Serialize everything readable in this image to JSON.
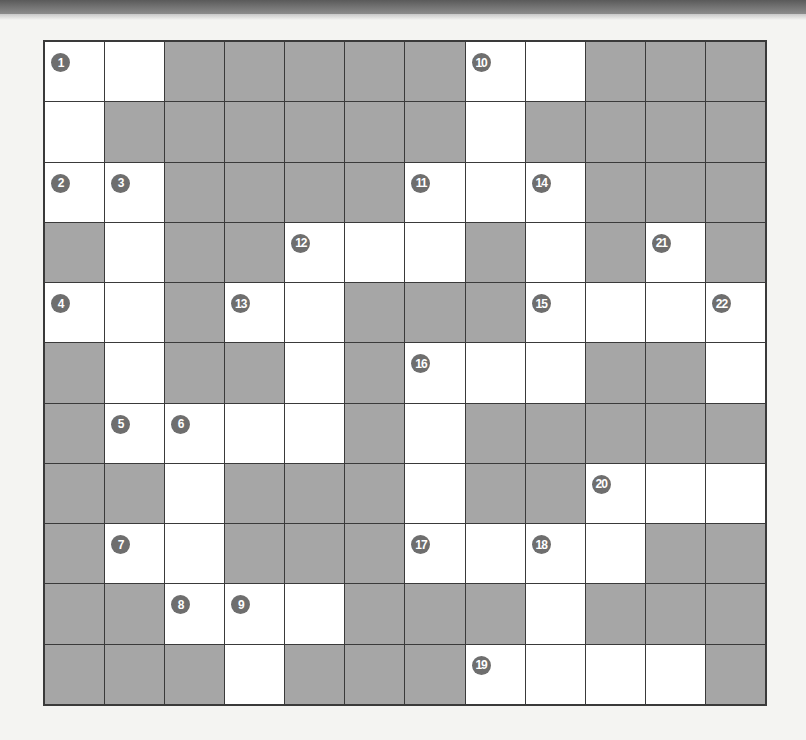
{
  "puzzle": {
    "type": "crossword",
    "rows": 11,
    "cols": 12,
    "colors": {
      "black_cell": "#a6a6a6",
      "white_cell": "#ffffff",
      "grid_line": "#3a3a3a",
      "clue_badge": "#6e6e6e"
    },
    "grid": [
      [
        "1",
        "W",
        "B",
        "B",
        "B",
        "B",
        "B",
        "10",
        "W",
        "B",
        "B",
        "B"
      ],
      [
        "W",
        "B",
        "B",
        "B",
        "B",
        "B",
        "B",
        "W",
        "B",
        "B",
        "B",
        "B"
      ],
      [
        "2",
        "3",
        "B",
        "B",
        "B",
        "B",
        "11",
        "W",
        "14",
        "B",
        "B",
        "B"
      ],
      [
        "B",
        "W",
        "B",
        "B",
        "12",
        "W",
        "W",
        "B",
        "W",
        "B",
        "21",
        "B"
      ],
      [
        "4",
        "W",
        "B",
        "13",
        "W",
        "B",
        "B",
        "B",
        "15",
        "W",
        "W",
        "22"
      ],
      [
        "B",
        "W",
        "B",
        "B",
        "W",
        "B",
        "16",
        "W",
        "W",
        "B",
        "B",
        "W"
      ],
      [
        "B",
        "5",
        "6",
        "W",
        "W",
        "B",
        "W",
        "B",
        "B",
        "B",
        "B",
        "B"
      ],
      [
        "B",
        "B",
        "W",
        "B",
        "B",
        "B",
        "W",
        "B",
        "B",
        "20",
        "W",
        "W"
      ],
      [
        "B",
        "7",
        "W",
        "B",
        "B",
        "B",
        "17",
        "W",
        "18",
        "W",
        "B",
        "B"
      ],
      [
        "B",
        "B",
        "8",
        "9",
        "W",
        "B",
        "B",
        "B",
        "W",
        "B",
        "B",
        "B"
      ],
      [
        "B",
        "B",
        "B",
        "W",
        "B",
        "B",
        "B",
        "19",
        "W",
        "W",
        "W",
        "B"
      ]
    ]
  }
}
